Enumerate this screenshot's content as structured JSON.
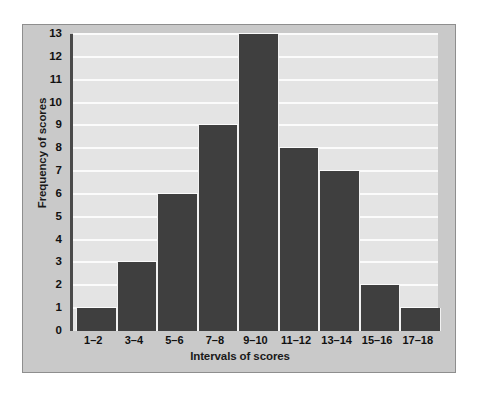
{
  "chart_data": {
    "type": "bar",
    "title": "",
    "xlabel": "Intervals of scores",
    "ylabel": "Frequency of scores",
    "categories": [
      "1–2",
      "3–4",
      "5–6",
      "7–8",
      "9–10",
      "11–12",
      "13–14",
      "15–16",
      "17–18"
    ],
    "values": [
      1,
      3,
      6,
      9,
      13,
      8,
      7,
      2,
      1
    ],
    "ylim": [
      0,
      13
    ],
    "ytick_labels": [
      "0",
      "1",
      "2",
      "3",
      "4",
      "5",
      "6",
      "7",
      "8",
      "9",
      "10",
      "11",
      "12",
      "13"
    ],
    "grid": "horizontal",
    "legend": "none",
    "colors": {
      "bar": "#3f3f3f",
      "plot_background": "#e4e4e4",
      "gridline": "#fbfbfb",
      "axis_spine": "#4a4a4a",
      "card_background": "#c9c9c9",
      "card_border": "#8e8e8e",
      "text": "#111111"
    }
  }
}
